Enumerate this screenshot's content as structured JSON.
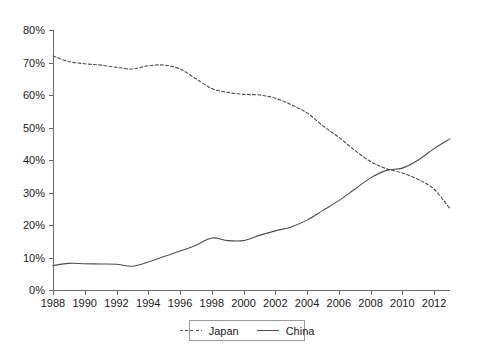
{
  "chart_data": {
    "type": "line",
    "title": "",
    "subtitle": "",
    "xlabel": "",
    "ylabel": "",
    "grid": false,
    "legend_position": "bottom",
    "xlim": [
      1988,
      2013
    ],
    "ylim": [
      0,
      80
    ],
    "y_tick_labels": [
      "0%",
      "10%",
      "20%",
      "30%",
      "40%",
      "50%",
      "60%",
      "70%",
      "80%"
    ],
    "y_tick_values": [
      0,
      10,
      20,
      30,
      40,
      50,
      60,
      70,
      80
    ],
    "x_tick_labels": [
      "1988",
      "1990",
      "1992",
      "1994",
      "1996",
      "1998",
      "2000",
      "2002",
      "2004",
      "2006",
      "2008",
      "2010",
      "2012"
    ],
    "x_tick_values": [
      1988,
      1990,
      1992,
      1994,
      1996,
      1998,
      2000,
      2002,
      2004,
      2006,
      2008,
      2010,
      2012
    ],
    "x": [
      1988,
      1989,
      1990,
      1991,
      1992,
      1993,
      1994,
      1995,
      1996,
      1997,
      1998,
      1999,
      2000,
      2001,
      2002,
      2003,
      2004,
      2005,
      2006,
      2007,
      2008,
      2009,
      2010,
      2011,
      2012,
      2013
    ],
    "series": [
      {
        "name": "Japan",
        "style": "dashed",
        "color": "#4d4d4d",
        "values": [
          72.0,
          70.3,
          69.4,
          68.6,
          68.0,
          68.3,
          69.0,
          69.2,
          68.8,
          68.6,
          69.5,
          68.8,
          66.5,
          64.0,
          61.5,
          60.2,
          59.8,
          58.8,
          57.6,
          55.5,
          52.5,
          49.8,
          46.0,
          42.0,
          38.5,
          37.3
        ],
        "note": "Japan series continues: 2009 crossover near 37%, declining to 25% by 2013"
      },
      {
        "name": "China",
        "style": "solid",
        "color": "#4d4d4d",
        "values": [
          7.5,
          8.2,
          8.2,
          8.0,
          7.9,
          7.6,
          8.6,
          10.0,
          11.5,
          13.4,
          16.0,
          15.3,
          15.2,
          16.5,
          18.6,
          20.2,
          21.5,
          23.2,
          26.0,
          29.5,
          33.0,
          36.8,
          39.0,
          41.5,
          44.0,
          46.5
        ]
      }
    ],
    "japan_full": {
      "x": [
        1988,
        1989,
        1990,
        1991,
        1992,
        1993,
        1994,
        1995,
        1996,
        1997,
        1998,
        1999,
        2000,
        2001,
        2002,
        2003,
        2004,
        2005,
        2006,
        2007,
        2008,
        2009,
        2010,
        2011,
        2012,
        2013
      ],
      "values": [
        72.0,
        70.3,
        69.6,
        69.2,
        68.5,
        68.0,
        69.0,
        69.2,
        68.0,
        65.0,
        62.0,
        60.8,
        60.2,
        60.0,
        59.0,
        57.0,
        54.5,
        50.5,
        47.0,
        43.0,
        39.5,
        37.3,
        36.0,
        34.0,
        31.0,
        25.0
      ]
    },
    "china_full": {
      "x": [
        1988,
        1989,
        1990,
        1991,
        1992,
        1993,
        1994,
        1995,
        1996,
        1997,
        1998,
        1999,
        2000,
        2001,
        2002,
        2003,
        2004,
        2005,
        2006,
        2007,
        2008,
        2009,
        2010,
        2011,
        2012,
        2013
      ],
      "values": [
        7.5,
        8.2,
        8.1,
        8.0,
        7.9,
        7.3,
        8.6,
        10.3,
        12.0,
        13.8,
        16.0,
        15.2,
        15.2,
        16.8,
        18.2,
        19.4,
        21.5,
        24.5,
        27.5,
        31.0,
        34.5,
        36.8,
        37.5,
        40.0,
        43.5,
        46.5
      ]
    },
    "crossover": {
      "year": 2009,
      "value": 37.0
    }
  },
  "legend": {
    "entries": [
      {
        "label": "Japan",
        "style": "dashed"
      },
      {
        "label": "China",
        "style": "solid"
      }
    ]
  }
}
